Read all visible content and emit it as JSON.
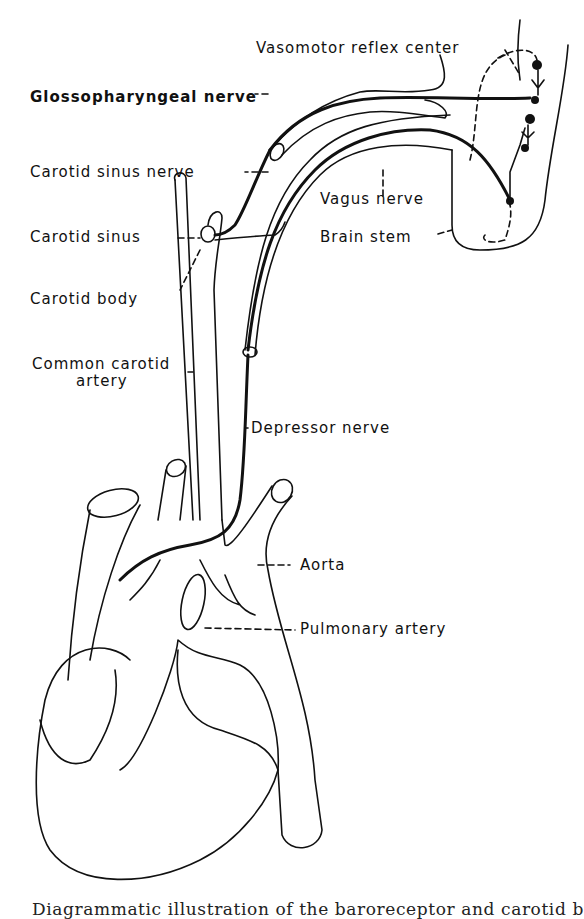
{
  "figure": {
    "type": "anatomical-line-diagram",
    "labels": {
      "vasomotor_reflex_center": "Vasomotor reflex center",
      "glossopharyngeal_nerve": "Glossopharyngeal nerve",
      "carotid_sinus_nerve": "Carotid sinus nerve",
      "vagus_nerve": "Vagus nerve",
      "carotid_sinus": "Carotid sinus",
      "brain_stem": "Brain stem",
      "carotid_body": "Carotid body",
      "common_carotid_artery_line1": "Common carotid",
      "common_carotid_artery_line2": "artery",
      "depressor_nerve": "Depressor nerve",
      "aorta": "Aorta",
      "pulmonary_artery": "Pulmonary artery"
    },
    "caption": "Diagrammatic illustration of the baroreceptor and carotid b"
  }
}
